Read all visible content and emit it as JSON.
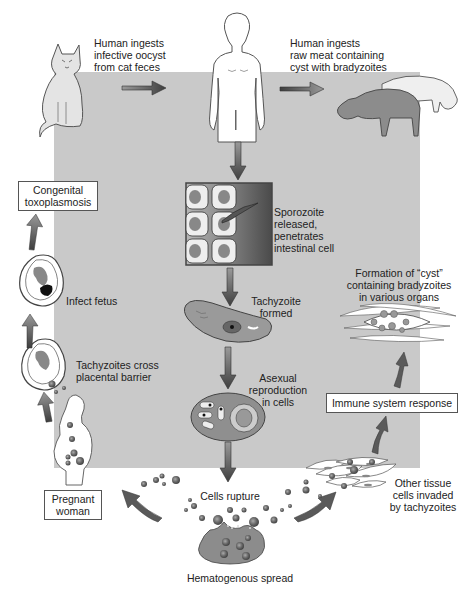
{
  "diagram": {
    "colors": {
      "panel": "#c9c9c9",
      "arrow": "#555555",
      "cell_fill": "#8a8a8a",
      "outline": "#444444",
      "box_border": "#555555"
    },
    "sources": {
      "cat_label": "Human ingests infective oocyst from cat feces",
      "cat_label_lines": [
        "Human ingests",
        "infective oocyst",
        "from cat feces"
      ],
      "meat_label_lines": [
        "Human ingests",
        "raw meat containing",
        "cyst with bradyzoites"
      ]
    },
    "central_path": {
      "sporozoite_lines": [
        "Sporozoite",
        "released,",
        "penetrates",
        "intestinal cell"
      ],
      "tachyzoite_lines": [
        "Tachyzoite",
        "formed"
      ],
      "asexual_lines": [
        "Asexual",
        "reproduction",
        "in cells"
      ],
      "rupture": "Cells rupture",
      "spread": "Hematogenous spread"
    },
    "left_path": {
      "pregnant_box_lines": [
        "Pregnant",
        "woman"
      ],
      "cross_lines": [
        "Tachyzoites cross",
        "placental barrier"
      ],
      "infect_fetus": "Infect fetus",
      "congenital_box_lines": [
        "Congenital",
        "toxoplasmosis"
      ]
    },
    "right_path": {
      "other_tissue_lines": [
        "Other tissue",
        "cells invaded",
        "by tachyzoites"
      ],
      "immune_box": "Immune system response",
      "cyst_lines": [
        "Formation of “cyst”",
        "containing bradyzoites",
        "in various organs"
      ]
    }
  }
}
